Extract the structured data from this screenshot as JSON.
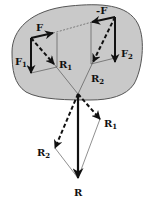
{
  "diagram": {
    "colors": {
      "body_fill": "#c9c9c9",
      "body_stroke": "#555555",
      "ink": "#111111",
      "thin_line": "#444444",
      "background": "#ffffff"
    },
    "labels": {
      "F": "F",
      "F1": "F",
      "F1_sub": "1",
      "R1_top": "R",
      "R1_top_sub": "1",
      "minus_F": "-F",
      "F2": "F",
      "F2_sub": "2",
      "R2_top": "R",
      "R2_top_sub": "2",
      "R1_bottom": "R",
      "R1_bottom_sub": "1",
      "R2_bottom": "R",
      "R2_bottom_sub": "2",
      "R": "R"
    },
    "vectors": [
      {
        "name": "F",
        "style": "solid",
        "from": [
          31,
          38
        ],
        "to": [
          53,
          33
        ]
      },
      {
        "name": "F1",
        "style": "solid",
        "from": [
          31,
          38
        ],
        "to": [
          31,
          73
        ]
      },
      {
        "name": "R1",
        "style": "dashed",
        "from": [
          31,
          38
        ],
        "to": [
          54,
          64
        ]
      },
      {
        "name": "-F",
        "style": "solid",
        "from": [
          115,
          17
        ],
        "to": [
          92,
          22
        ]
      },
      {
        "name": "F2",
        "style": "solid",
        "from": [
          115,
          17
        ],
        "to": [
          115,
          62
        ]
      },
      {
        "name": "R2",
        "style": "dashed",
        "from": [
          115,
          17
        ],
        "to": [
          93,
          62
        ]
      },
      {
        "name": "R",
        "style": "solid",
        "from": [
          78,
          94
        ],
        "to": [
          78,
          178
        ]
      },
      {
        "name": "R1_translated",
        "style": "dashed",
        "from": [
          78,
          94
        ],
        "to": [
          100,
          119
        ]
      },
      {
        "name": "R2_translated",
        "style": "dashed",
        "from": [
          78,
          94
        ],
        "to": [
          55,
          148
        ]
      }
    ]
  }
}
